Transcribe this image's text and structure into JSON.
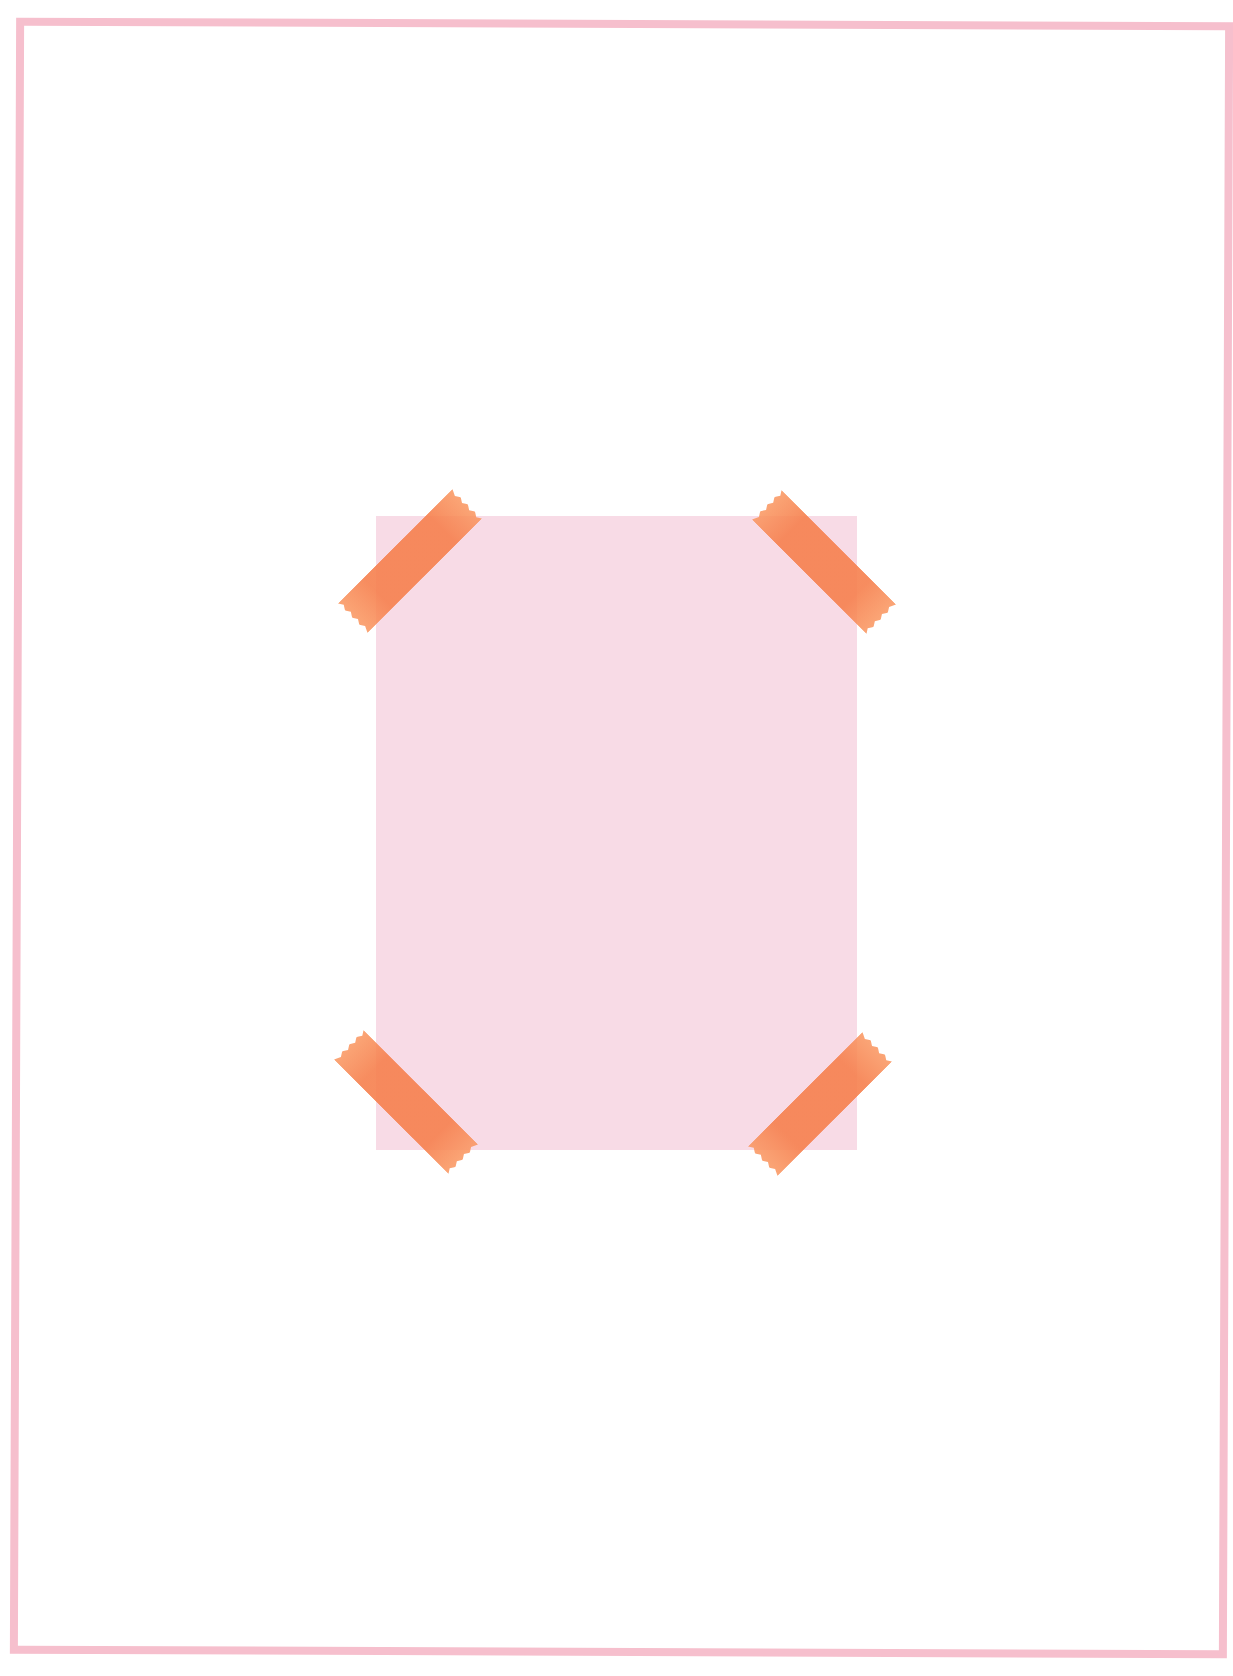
{
  "page": {
    "background_color": "#ffffff",
    "frame_color": "#f6bfcd",
    "frame_thickness_px": 8
  },
  "photo_card": {
    "fill_color": "#f8dbe6",
    "text": ""
  },
  "tapes": [
    {
      "position": "top-left",
      "color": "#f6804e",
      "angle_deg": -45
    },
    {
      "position": "top-right",
      "color": "#f6804e",
      "angle_deg": 45
    },
    {
      "position": "bottom-left",
      "color": "#f6804e",
      "angle_deg": 45
    },
    {
      "position": "bottom-right",
      "color": "#f6804e",
      "angle_deg": -45
    }
  ]
}
